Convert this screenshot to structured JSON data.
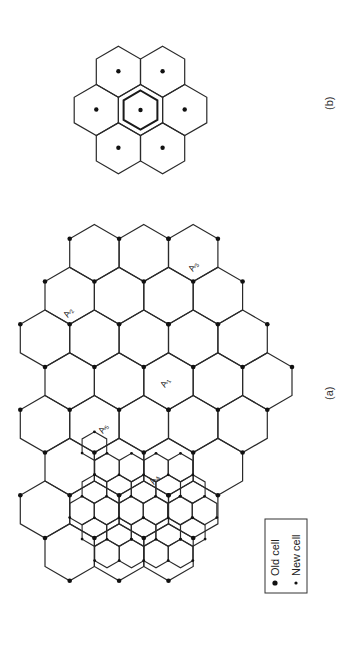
{
  "figure": {
    "panel_a": {
      "label": "(a)",
      "cell_labels": [
        {
          "text": "A",
          "sub": "1",
          "x": 165,
          "y": 388
        },
        {
          "text": "A",
          "sub": "2",
          "x": 68,
          "y": 318
        },
        {
          "text": "A",
          "sub": "3",
          "x": 193,
          "y": 272
        },
        {
          "text": "A",
          "sub": "4",
          "x": 154,
          "y": 485
        },
        {
          "text": "A",
          "sub": "5",
          "x": 103,
          "y": 434
        }
      ]
    },
    "panel_b": {
      "label": "(b)"
    },
    "legend": {
      "old_cell": "Old cell",
      "new_cell": "New cell"
    },
    "colors": {
      "line": "#2a2a2a",
      "dot": "#111111",
      "background": "#ffffff"
    }
  }
}
